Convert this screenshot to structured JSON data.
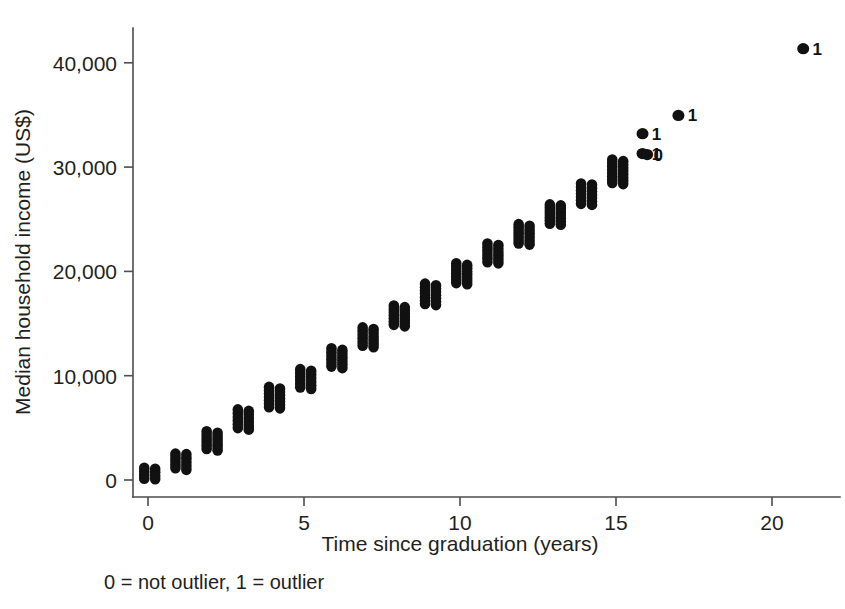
{
  "chart_data": {
    "type": "scatter",
    "title": "",
    "xlabel": "Time since graduation (years)",
    "ylabel": "Median household income (US$)",
    "xlim": [
      -0.55,
      22.3
    ],
    "ylim": [
      -1400,
      45000
    ],
    "xticks": [
      0,
      5,
      10,
      15,
      20
    ],
    "xticklabels": [
      "0",
      "5",
      "10",
      "15",
      "20"
    ],
    "yticks": [
      0,
      10000,
      20000,
      30000,
      40000
    ],
    "yticklabels": [
      "0",
      "10,000",
      "20,000",
      "30,000",
      "40,000"
    ],
    "grid": false,
    "legend": null,
    "caption": "0 = not outlier, 1 = outlier",
    "marker_color": "#111111",
    "axis_color": "#4d4d4d",
    "text_color": "#231f20",
    "series": [
      {
        "name": "not outlier",
        "label_glyph": "0",
        "description": "Paired vertical columns of stacked points at each year; left column filled dots, right column dots annotated with 0",
        "columns": [
          {
            "x": 0.0,
            "x_offset": -0.12,
            "y_low": 150,
            "y_high": 1150
          },
          {
            "x": 0.0,
            "x_offset": 0.23,
            "y_low": 100,
            "y_high": 1050
          },
          {
            "x": 1.0,
            "x_offset": -0.12,
            "y_low": 1150,
            "y_high": 2500
          },
          {
            "x": 1.0,
            "x_offset": 0.23,
            "y_low": 1000,
            "y_high": 2450
          },
          {
            "x": 2.0,
            "x_offset": -0.12,
            "y_low": 3000,
            "y_high": 4650
          },
          {
            "x": 2.0,
            "x_offset": 0.23,
            "y_low": 2850,
            "y_high": 4500
          },
          {
            "x": 3.0,
            "x_offset": -0.12,
            "y_low": 5000,
            "y_high": 6750
          },
          {
            "x": 3.0,
            "x_offset": 0.23,
            "y_low": 4850,
            "y_high": 6600
          },
          {
            "x": 4.0,
            "x_offset": -0.12,
            "y_low": 7000,
            "y_high": 8900
          },
          {
            "x": 4.0,
            "x_offset": 0.23,
            "y_low": 6900,
            "y_high": 8750
          },
          {
            "x": 5.0,
            "x_offset": -0.12,
            "y_low": 8900,
            "y_high": 10600
          },
          {
            "x": 5.0,
            "x_offset": 0.23,
            "y_low": 8750,
            "y_high": 10450
          },
          {
            "x": 6.0,
            "x_offset": -0.12,
            "y_low": 10900,
            "y_high": 12600
          },
          {
            "x": 6.0,
            "x_offset": 0.23,
            "y_low": 10750,
            "y_high": 12450
          },
          {
            "x": 7.0,
            "x_offset": -0.12,
            "y_low": 12900,
            "y_high": 14600
          },
          {
            "x": 7.0,
            "x_offset": 0.23,
            "y_low": 12750,
            "y_high": 14450
          },
          {
            "x": 8.0,
            "x_offset": -0.12,
            "y_low": 14900,
            "y_high": 16700
          },
          {
            "x": 8.0,
            "x_offset": 0.23,
            "y_low": 14750,
            "y_high": 16550
          },
          {
            "x": 9.0,
            "x_offset": -0.12,
            "y_low": 16900,
            "y_high": 18800
          },
          {
            "x": 9.0,
            "x_offset": 0.23,
            "y_low": 16800,
            "y_high": 18650
          },
          {
            "x": 10.0,
            "x_offset": -0.12,
            "y_low": 18900,
            "y_high": 20750
          },
          {
            "x": 10.0,
            "x_offset": 0.23,
            "y_low": 18800,
            "y_high": 20600
          },
          {
            "x": 11.0,
            "x_offset": -0.12,
            "y_low": 20900,
            "y_high": 22650
          },
          {
            "x": 11.0,
            "x_offset": 0.23,
            "y_low": 20800,
            "y_high": 22500
          },
          {
            "x": 12.0,
            "x_offset": -0.12,
            "y_low": 22700,
            "y_high": 24500
          },
          {
            "x": 12.0,
            "x_offset": 0.23,
            "y_low": 22600,
            "y_high": 24350
          },
          {
            "x": 13.0,
            "x_offset": -0.12,
            "y_low": 24600,
            "y_high": 26400
          },
          {
            "x": 13.0,
            "x_offset": 0.23,
            "y_low": 24500,
            "y_high": 26300
          },
          {
            "x": 14.0,
            "x_offset": -0.12,
            "y_low": 26500,
            "y_high": 28400
          },
          {
            "x": 14.0,
            "x_offset": 0.23,
            "y_low": 26400,
            "y_high": 28300
          },
          {
            "x": 15.0,
            "x_offset": -0.12,
            "y_low": 28500,
            "y_high": 30700
          },
          {
            "x": 15.0,
            "x_offset": 0.23,
            "y_low": 28400,
            "y_high": 30550
          }
        ],
        "single_points": [
          {
            "x": 16.0,
            "y": 31200,
            "glyph": "0"
          }
        ]
      },
      {
        "name": "outlier",
        "label_glyph": "1",
        "description": "Isolated labelled points flagged as outliers",
        "points": [
          {
            "x": 15.85,
            "y": 33200,
            "label": "1"
          },
          {
            "x": 15.85,
            "y": 31300,
            "label": "1"
          },
          {
            "x": 17.0,
            "y": 34950,
            "label": "1"
          },
          {
            "x": 21.0,
            "y": 41350,
            "label": "1"
          }
        ]
      }
    ]
  },
  "figure": {
    "x_axis_title": "Time since graduation (years)",
    "y_axis_title": "Median household income (US$)",
    "caption": "0 = not outlier, 1 = outlier"
  }
}
